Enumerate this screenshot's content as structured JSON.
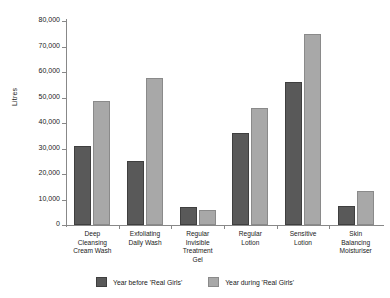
{
  "chart_data": {
    "type": "bar",
    "title": "",
    "xlabel": "",
    "ylabel": "Litres",
    "ylim": [
      0,
      80000
    ],
    "ytick_labels": [
      "80,000",
      "70,000",
      "60,000",
      "50,000",
      "40,000",
      "30,000",
      "20,000",
      "10,000",
      "0"
    ],
    "ytick_values": [
      80000,
      70000,
      60000,
      50000,
      40000,
      30000,
      20000,
      10000,
      0
    ],
    "grid": false,
    "legend_position": "bottom",
    "categories": [
      "Deep Cleansing Cream Wash",
      "Exfoliating Daily Wash",
      "Regular Invisible Treatment Gel",
      "Regular Lotion",
      "Sensitive Lotion",
      "Skin Balancing Moisturiser"
    ],
    "category_lines": [
      [
        "Deep",
        "Cleansing",
        "Cream Wash"
      ],
      [
        "Exfoliating",
        "Daily Wash"
      ],
      [
        "Regular",
        "Invisible",
        "Treatment",
        "Gel"
      ],
      [
        "Regular",
        "Lotion"
      ],
      [
        "Sensitive",
        "Lotion"
      ],
      [
        "Skin",
        "Balancing",
        "Moisturiser"
      ]
    ],
    "series": [
      {
        "name": "Year before 'Real Girls'",
        "color": "#595959",
        "values": [
          31000,
          25000,
          7000,
          36000,
          56000,
          7500
        ]
      },
      {
        "name": "Year during 'Real Girls'",
        "color": "#a8a8a8",
        "values": [
          48500,
          57500,
          6000,
          46000,
          75000,
          13500
        ]
      }
    ]
  }
}
